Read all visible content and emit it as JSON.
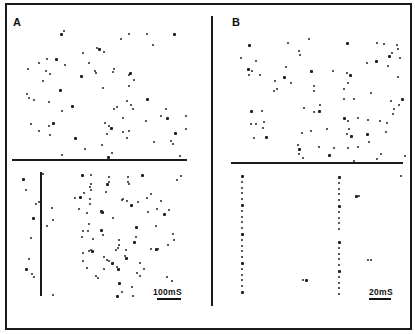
{
  "figure": {
    "panels": [
      {
        "label": "A",
        "scale_bar": "100mS",
        "description": "Spike raster: upper section scattered spikes, lower section aligned to stimulus marker (vertical line)"
      },
      {
        "label": "B",
        "scale_bar": "20mS",
        "description": "Spike raster: upper section scattered spikes, lower section shows two phase-locked spike columns"
      }
    ]
  },
  "colors": {
    "ink": "#1a1a1a",
    "background": "#ffffff"
  },
  "dots": {
    "a_top": [
      [
        60,
        33
      ],
      [
        63,
        30
      ],
      [
        120,
        38
      ],
      [
        128,
        33
      ],
      [
        146,
        33
      ],
      [
        173,
        33
      ],
      [
        152,
        44
      ],
      [
        82,
        52
      ],
      [
        96,
        47
      ],
      [
        103,
        51
      ],
      [
        98,
        48
      ],
      [
        88,
        62
      ],
      [
        46,
        58
      ],
      [
        38,
        62
      ],
      [
        27,
        68
      ],
      [
        55,
        58
      ],
      [
        64,
        64
      ],
      [
        45,
        70
      ],
      [
        42,
        80
      ],
      [
        49,
        73
      ],
      [
        80,
        75
      ],
      [
        95,
        72
      ],
      [
        94,
        70
      ],
      [
        112,
        71
      ],
      [
        113,
        68
      ],
      [
        129,
        72
      ],
      [
        128,
        74
      ],
      [
        133,
        79
      ],
      [
        128,
        85
      ],
      [
        102,
        87
      ],
      [
        59,
        89
      ],
      [
        26,
        93
      ],
      [
        33,
        99
      ],
      [
        28,
        97
      ],
      [
        48,
        101
      ],
      [
        71,
        105
      ],
      [
        61,
        110
      ],
      [
        116,
        106
      ],
      [
        126,
        100
      ],
      [
        130,
        104
      ],
      [
        146,
        98
      ],
      [
        113,
        108
      ],
      [
        132,
        108
      ],
      [
        165,
        108
      ],
      [
        160,
        115
      ],
      [
        166,
        117
      ],
      [
        185,
        115
      ],
      [
        122,
        117
      ],
      [
        145,
        120
      ],
      [
        30,
        123
      ],
      [
        52,
        122
      ],
      [
        48,
        125
      ],
      [
        38,
        130
      ],
      [
        104,
        122
      ],
      [
        108,
        125
      ],
      [
        110,
        127
      ],
      [
        122,
        131
      ],
      [
        128,
        130
      ],
      [
        126,
        137
      ],
      [
        49,
        134
      ],
      [
        74,
        137
      ],
      [
        106,
        133
      ],
      [
        153,
        141
      ],
      [
        170,
        140
      ],
      [
        172,
        143
      ],
      [
        174,
        132
      ],
      [
        185,
        128
      ],
      [
        101,
        144
      ],
      [
        84,
        148
      ],
      [
        111,
        152
      ],
      [
        107,
        156
      ],
      [
        179,
        155
      ],
      [
        61,
        154
      ]
    ],
    "a_bottom": [
      [
        22,
        178
      ],
      [
        25,
        189
      ],
      [
        35,
        203
      ],
      [
        38,
        201
      ],
      [
        51,
        207
      ],
      [
        32,
        217
      ],
      [
        52,
        219
      ],
      [
        46,
        225
      ],
      [
        30,
        237
      ],
      [
        28,
        258
      ],
      [
        25,
        268
      ],
      [
        31,
        273
      ],
      [
        33,
        276
      ],
      [
        52,
        294
      ],
      [
        42,
        173
      ],
      [
        81,
        174
      ],
      [
        90,
        174
      ],
      [
        108,
        176
      ],
      [
        108,
        181
      ],
      [
        127,
        176
      ],
      [
        141,
        174
      ],
      [
        180,
        175
      ],
      [
        176,
        179
      ],
      [
        90,
        183
      ],
      [
        89,
        186
      ],
      [
        106,
        183
      ],
      [
        105,
        191
      ],
      [
        127,
        181
      ],
      [
        128,
        183
      ],
      [
        74,
        197
      ],
      [
        79,
        196
      ],
      [
        83,
        192
      ],
      [
        90,
        189
      ],
      [
        89,
        198
      ],
      [
        89,
        203
      ],
      [
        101,
        211
      ],
      [
        146,
        197
      ],
      [
        150,
        193
      ],
      [
        121,
        199
      ],
      [
        126,
        200
      ],
      [
        130,
        204
      ],
      [
        137,
        201
      ],
      [
        122,
        198
      ],
      [
        156,
        208
      ],
      [
        160,
        200
      ],
      [
        163,
        213
      ],
      [
        168,
        209
      ],
      [
        147,
        211
      ],
      [
        78,
        208
      ],
      [
        86,
        212
      ],
      [
        100,
        210
      ],
      [
        112,
        217
      ],
      [
        88,
        223
      ],
      [
        87,
        230
      ],
      [
        82,
        230
      ],
      [
        100,
        229
      ],
      [
        102,
        234
      ],
      [
        81,
        236
      ],
      [
        92,
        238
      ],
      [
        118,
        239
      ],
      [
        135,
        226
      ],
      [
        155,
        225
      ],
      [
        172,
        233
      ],
      [
        173,
        239
      ],
      [
        167,
        244
      ],
      [
        155,
        248
      ],
      [
        117,
        247
      ],
      [
        118,
        244
      ],
      [
        125,
        249
      ],
      [
        135,
        236
      ],
      [
        133,
        241
      ],
      [
        115,
        249
      ],
      [
        82,
        252
      ],
      [
        88,
        250
      ],
      [
        90,
        249
      ],
      [
        91,
        250
      ],
      [
        124,
        255
      ],
      [
        150,
        248
      ],
      [
        155,
        249
      ],
      [
        157,
        248
      ],
      [
        125,
        257
      ],
      [
        82,
        260
      ],
      [
        103,
        256
      ],
      [
        106,
        259
      ],
      [
        108,
        260
      ],
      [
        111,
        262
      ],
      [
        139,
        262
      ],
      [
        143,
        268
      ],
      [
        136,
        272
      ],
      [
        116,
        266
      ],
      [
        117,
        268
      ],
      [
        103,
        268
      ],
      [
        86,
        267
      ],
      [
        95,
        275
      ],
      [
        97,
        277
      ],
      [
        118,
        282
      ],
      [
        131,
        286
      ],
      [
        139,
        275
      ],
      [
        166,
        276
      ],
      [
        171,
        280
      ],
      [
        116,
        295
      ],
      [
        121,
        291
      ],
      [
        132,
        295
      ]
    ],
    "b_top": [
      [
        248,
        44
      ],
      [
        287,
        42
      ],
      [
        308,
        38
      ],
      [
        298,
        50
      ],
      [
        299,
        54
      ],
      [
        346,
        42
      ],
      [
        376,
        42
      ],
      [
        383,
        43
      ],
      [
        396,
        44
      ],
      [
        391,
        52
      ],
      [
        388,
        55
      ],
      [
        397,
        48
      ],
      [
        399,
        57
      ],
      [
        240,
        57
      ],
      [
        255,
        60
      ],
      [
        247,
        68
      ],
      [
        251,
        70
      ],
      [
        248,
        74
      ],
      [
        259,
        74
      ],
      [
        285,
        66
      ],
      [
        283,
        76
      ],
      [
        274,
        80
      ],
      [
        273,
        90
      ],
      [
        276,
        88
      ],
      [
        290,
        82
      ],
      [
        310,
        70
      ],
      [
        313,
        85
      ],
      [
        313,
        90
      ],
      [
        332,
        70
      ],
      [
        346,
        72
      ],
      [
        349,
        74
      ],
      [
        347,
        82
      ],
      [
        343,
        88
      ],
      [
        343,
        98
      ],
      [
        366,
        62
      ],
      [
        375,
        60
      ],
      [
        370,
        92
      ],
      [
        353,
        98
      ],
      [
        387,
        65
      ],
      [
        397,
        76
      ],
      [
        401,
        98
      ],
      [
        398,
        104
      ],
      [
        390,
        100
      ],
      [
        393,
        108
      ],
      [
        392,
        113
      ],
      [
        250,
        110
      ],
      [
        261,
        110
      ],
      [
        263,
        121
      ],
      [
        255,
        123
      ],
      [
        262,
        127
      ],
      [
        265,
        136
      ],
      [
        253,
        137
      ],
      [
        250,
        123
      ],
      [
        303,
        107
      ],
      [
        319,
        104
      ],
      [
        318,
        110
      ],
      [
        313,
        111
      ],
      [
        301,
        132
      ],
      [
        310,
        130
      ],
      [
        326,
        128
      ],
      [
        343,
        117
      ],
      [
        347,
        120
      ],
      [
        357,
        117
      ],
      [
        348,
        128
      ],
      [
        346,
        133
      ],
      [
        350,
        135
      ],
      [
        367,
        119
      ],
      [
        379,
        120
      ],
      [
        386,
        122
      ],
      [
        385,
        131
      ],
      [
        366,
        133
      ],
      [
        368,
        141
      ],
      [
        357,
        146
      ],
      [
        347,
        147
      ],
      [
        297,
        144
      ],
      [
        298,
        148
      ],
      [
        298,
        153
      ],
      [
        302,
        157
      ],
      [
        318,
        146
      ],
      [
        333,
        147
      ],
      [
        328,
        154
      ],
      [
        380,
        153
      ],
      [
        376,
        158
      ],
      [
        404,
        155
      ],
      [
        353,
        160
      ]
    ],
    "b_bottom": [
      [
        355,
        195
      ],
      [
        358,
        195
      ],
      [
        367,
        259
      ],
      [
        370,
        259
      ],
      [
        302,
        279
      ],
      [
        305,
        279
      ],
      [
        400,
        175
      ]
    ]
  }
}
